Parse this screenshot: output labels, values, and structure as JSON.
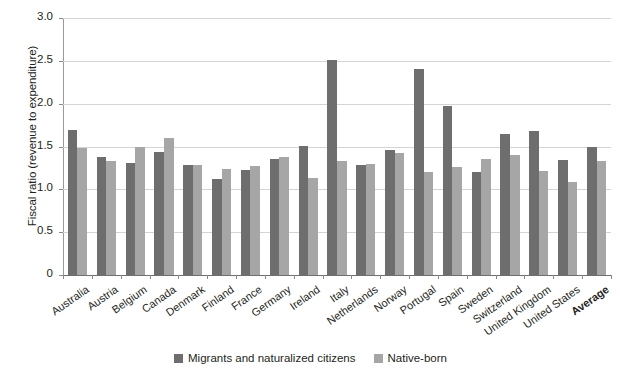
{
  "chart_data": {
    "type": "bar",
    "title": "",
    "xlabel": "",
    "ylabel": "Fiscal ratio (revenue to expenditure)",
    "ylim": [
      0,
      3.0
    ],
    "yticks": [
      "0",
      "0.5",
      "1.0",
      "1.5",
      "2.0",
      "2.5",
      "3.0"
    ],
    "ytick_values": [
      0,
      0.5,
      1.0,
      1.5,
      2.0,
      2.5,
      3.0
    ],
    "grid": "horizontal",
    "legend_position": "bottom-center",
    "categories": [
      "Australia",
      "Austria",
      "Belgium",
      "Canada",
      "Denmark",
      "Finland",
      "France",
      "Germany",
      "Ireland",
      "Italy",
      "Netherlands",
      "Norway",
      "Portugal",
      "Spain",
      "Sweden",
      "Switzerland",
      "United Kingdom",
      "United States",
      "Average"
    ],
    "emphasized_categories": [
      "Average"
    ],
    "series": [
      {
        "name": "Migrants and naturalized citizens",
        "color": "#6e6e6e",
        "values": [
          1.69,
          1.38,
          1.31,
          1.44,
          1.28,
          1.12,
          1.23,
          1.36,
          1.51,
          2.51,
          1.29,
          1.46,
          2.41,
          1.97,
          1.2,
          1.65,
          1.68,
          1.34,
          1.5
        ]
      },
      {
        "name": "Native-born",
        "color": "#a6a6a6",
        "values": [
          1.48,
          1.33,
          1.49,
          1.6,
          1.28,
          1.24,
          1.27,
          1.38,
          1.13,
          1.33,
          1.3,
          1.42,
          1.2,
          1.26,
          1.35,
          1.4,
          1.22,
          1.09,
          1.33
        ]
      }
    ]
  },
  "legend": {
    "items": [
      {
        "label": "Migrants and naturalized citizens",
        "color": "#6e6e6e"
      },
      {
        "label": "Native-born",
        "color": "#a6a6a6"
      }
    ]
  },
  "colors": {
    "series_migrants": "#6e6e6e",
    "series_native": "#a6a6a6",
    "gridline": "#d4d4d4",
    "axis": "#8a8a8a",
    "text": "#231f20",
    "background": "#ffffff"
  }
}
